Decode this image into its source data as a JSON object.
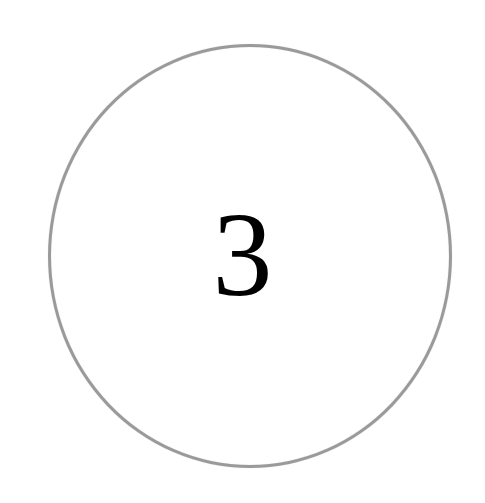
{
  "badge": {
    "number": "3",
    "ring_color": "#9a9a9a",
    "text_color": "#000000"
  }
}
